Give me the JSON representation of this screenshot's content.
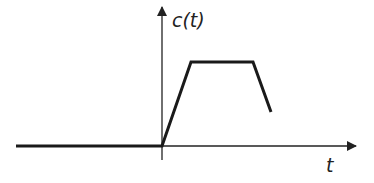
{
  "diagram": {
    "type": "signal-waveform",
    "y_label": "c(t)",
    "x_label": "t",
    "colors": {
      "axis": "#222222",
      "signal": "#1a1a1a",
      "background": "#ffffff"
    },
    "axes": {
      "origin_px": [
        162,
        146
      ],
      "x_axis": {
        "from_px": [
          16,
          146
        ],
        "to_px": [
          357,
          146
        ]
      },
      "y_axis": {
        "from_px": [
          162,
          160
        ],
        "to_px": [
          162,
          6
        ]
      }
    },
    "signal_points_px": [
      [
        16,
        146
      ],
      [
        162,
        146
      ],
      [
        191,
        62
      ],
      [
        253,
        62
      ],
      [
        271,
        112
      ]
    ],
    "segments": [
      {
        "name": "zero-segment",
        "description": "c(t)=0 for t<0"
      },
      {
        "name": "rising-ramp",
        "description": "linear rise from origin"
      },
      {
        "name": "plateau",
        "description": "constant value"
      },
      {
        "name": "falling-ramp",
        "description": "linear decrease, ends partway down"
      }
    ]
  }
}
